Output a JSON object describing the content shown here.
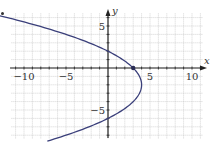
{
  "chart_data": {
    "type": "line",
    "title": "",
    "xlabel": "x",
    "ylabel": "y",
    "xlim": [
      -11,
      11.5
    ],
    "ylim": [
      -9,
      7
    ],
    "grid": true,
    "grid_step": 1,
    "x_ticks": [
      -10,
      -5,
      5,
      10
    ],
    "x_tick_labels": [
      "−10",
      "−5",
      "5",
      "10"
    ],
    "y_ticks": [
      5,
      -5
    ],
    "y_tick_labels": [
      "5",
      "−5"
    ],
    "series": [
      {
        "name": "x = 4 - (y+2)^2/4",
        "color": "#3a3f7a",
        "y_range": [
          -8.7,
          6.6
        ],
        "points": [
          {
            "x": -11.0,
            "y": 6.6
          },
          {
            "x": -8.0,
            "y": 4.9
          },
          {
            "x": -5.0,
            "y": 4.0
          },
          {
            "x": 0,
            "y": 2
          },
          {
            "x": 3,
            "y": 0
          },
          {
            "x": 4,
            "y": -2
          },
          {
            "x": 3,
            "y": -4
          },
          {
            "x": 0,
            "y": -6
          },
          {
            "x": -5.0,
            "y": -8.0
          }
        ]
      }
    ],
    "annotations": [
      {
        "type": "point",
        "x": 3,
        "y": 0,
        "label": ""
      }
    ]
  },
  "colors": {
    "axis": "#222222",
    "grid": "#b8b8b8",
    "curve": "#3a3f7a"
  }
}
